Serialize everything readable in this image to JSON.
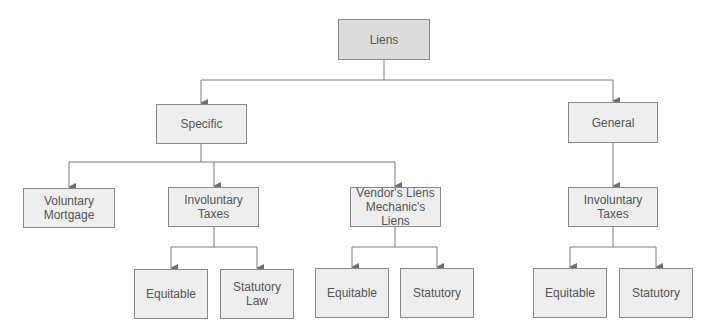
{
  "diagram": {
    "type": "tree",
    "colors": {
      "line": "#7a7a7a",
      "box_fill": "#eeeeee",
      "root_fill": "#dcdcdc",
      "box_border": "#8a8a8a",
      "text": "#555555"
    },
    "nodes": {
      "liens": {
        "label": "Liens"
      },
      "specific": {
        "label": "Specific"
      },
      "general": {
        "label": "General"
      },
      "voluntary": {
        "label": "Voluntary\nMortgage"
      },
      "involuntary_specific": {
        "label": "Involuntary\nTaxes"
      },
      "vendors": {
        "label": "Vendor's Liens\nMechanic's Liens"
      },
      "involuntary_general": {
        "label": "Involuntary\nTaxes"
      },
      "equitable_1": {
        "label": "Equitable"
      },
      "statutory_law_1": {
        "label": "Statutory\nLaw"
      },
      "equitable_2": {
        "label": "Equitable"
      },
      "statutory_2": {
        "label": "Statutory"
      },
      "equitable_3": {
        "label": "Equitable"
      },
      "statutory_3": {
        "label": "Statutory"
      }
    },
    "edges": [
      [
        "Liens",
        "Specific"
      ],
      [
        "Liens",
        "General"
      ],
      [
        "Specific",
        "Voluntary Mortgage"
      ],
      [
        "Specific",
        "Involuntary Taxes"
      ],
      [
        "Specific",
        "Vendor's Liens / Mechanic's Liens"
      ],
      [
        "General",
        "Involuntary Taxes"
      ],
      [
        "Involuntary Taxes (Specific)",
        "Equitable"
      ],
      [
        "Involuntary Taxes (Specific)",
        "Statutory Law"
      ],
      [
        "Vendor's Liens / Mechanic's Liens",
        "Equitable"
      ],
      [
        "Vendor's Liens / Mechanic's Liens",
        "Statutory"
      ],
      [
        "Involuntary Taxes (General)",
        "Equitable"
      ],
      [
        "Involuntary Taxes (General)",
        "Statutory"
      ]
    ]
  }
}
